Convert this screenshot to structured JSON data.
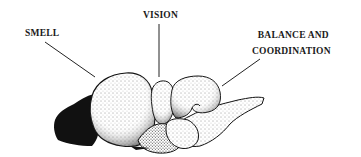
{
  "diagram": {
    "labels": [
      {
        "id": "smell",
        "text": "SMELL"
      },
      {
        "id": "vision",
        "text": "VISION"
      },
      {
        "id": "balance",
        "lines": [
          "BALANCE AND",
          "COORDINATION"
        ]
      }
    ],
    "colors": {
      "ink": "#1a1a1a",
      "background": "#ffffff"
    }
  }
}
